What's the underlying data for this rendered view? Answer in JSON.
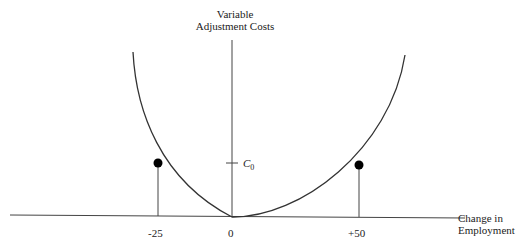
{
  "diagram": {
    "y_axis_label_line1": "Variable",
    "y_axis_label_line2": "Adjustment Costs",
    "x_axis_label_line1": "Change in",
    "x_axis_label_line2": "Employment",
    "c0_label": "C",
    "c0_subscript": "0",
    "x_ticks": [
      "-25",
      "0",
      "+50"
    ],
    "points": [
      {
        "x": -25,
        "label": "-25"
      },
      {
        "x": 50,
        "label": "+50"
      }
    ],
    "colors": {
      "line": "#333333",
      "dot": "#000000"
    }
  }
}
